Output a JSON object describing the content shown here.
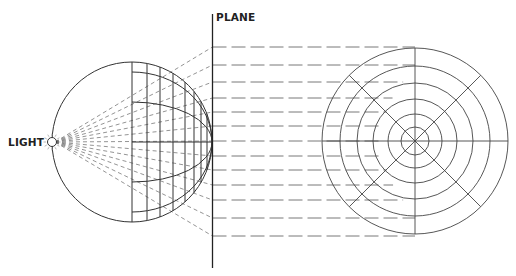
{
  "diagram": {
    "labels": {
      "light": "LIGHT",
      "plane": "PLANE"
    },
    "colors": {
      "stroke": "#333333",
      "dashed": "#666666",
      "background": "#ffffff"
    },
    "sphere": {
      "cx": 132,
      "cy": 142,
      "r": 80
    },
    "light_source": {
      "cx": 52,
      "cy": 142,
      "r": 4.5
    },
    "plane": {
      "x": 212.5,
      "y1": 14,
      "y2": 268
    },
    "projection": {
      "cx": 415,
      "cy": 141,
      "ring_radii": [
        93,
        75,
        58,
        42,
        27,
        14
      ],
      "spokes_deg": [
        0,
        45,
        90,
        135
      ]
    },
    "projector_rows_y": [
      47,
      65,
      82,
      98,
      112,
      126,
      141,
      156,
      170,
      185,
      200,
      218,
      236
    ]
  }
}
